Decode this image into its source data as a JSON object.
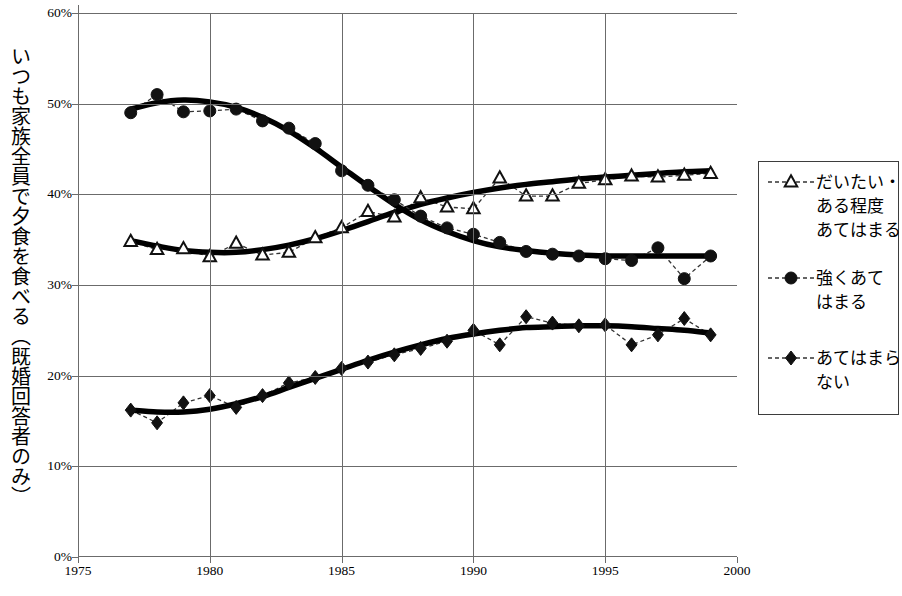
{
  "chart_data": {
    "type": "line",
    "title": "",
    "xlabel": "",
    "ylabel": "いつも家族全員で夕食を食べる（既婚回答者のみ）",
    "xlim": [
      1975,
      2000
    ],
    "ylim": [
      0,
      60
    ],
    "xticks": [
      1975,
      1980,
      1985,
      1990,
      1995,
      2000
    ],
    "xtick_labels": [
      "1975",
      "1980",
      "1985",
      "1990",
      "1995",
      "2000"
    ],
    "yticks": [
      0,
      10,
      20,
      30,
      40,
      50,
      60
    ],
    "ytick_labels": [
      "0%",
      "10%",
      "20%",
      "30%",
      "40%",
      "50%",
      "60%"
    ],
    "grid": "horizontal-and-vertical",
    "legend_position": "right-outside",
    "x": [
      1977,
      1978,
      1979,
      1980,
      1981,
      1982,
      1983,
      1984,
      1985,
      1986,
      1987,
      1988,
      1989,
      1990,
      1991,
      1992,
      1993,
      1994,
      1995,
      1996,
      1997,
      1998,
      1999
    ],
    "series": [
      {
        "name": "だいたい・\nある程度\nあてはまる",
        "marker": "open-triangle",
        "line": "dashed",
        "values": [
          34.8,
          33.9,
          34.0,
          33.1,
          34.6,
          33.3,
          33.6,
          35.2,
          36.3,
          38.1,
          37.5,
          39.6,
          38.6,
          38.4,
          41.8,
          39.8,
          39.8,
          41.2,
          41.6,
          42.0,
          41.9,
          42.1,
          42.3
        ],
        "trend": [
          34.9,
          34.3,
          33.8,
          33.6,
          33.6,
          33.9,
          34.4,
          35.1,
          36.0,
          37.0,
          38.0,
          38.9,
          39.6,
          40.2,
          40.7,
          41.1,
          41.4,
          41.7,
          41.9,
          42.1,
          42.3,
          42.5,
          42.6
        ]
      },
      {
        "name": "強くあて\nはまる",
        "marker": "filled-circle",
        "line": "dashed",
        "values": [
          49.0,
          51.0,
          49.1,
          49.2,
          49.4,
          48.1,
          47.3,
          45.6,
          42.6,
          41.0,
          39.4,
          37.6,
          36.3,
          35.6,
          34.7,
          33.7,
          33.4,
          33.2,
          32.9,
          32.7,
          34.1,
          30.7,
          33.2
        ],
        "trend": [
          49.4,
          50.1,
          50.4,
          50.2,
          49.6,
          48.5,
          47.0,
          45.1,
          43.0,
          40.9,
          38.9,
          37.2,
          35.9,
          34.9,
          34.2,
          33.8,
          33.5,
          33.3,
          33.2,
          33.2,
          33.2,
          33.2,
          33.2
        ]
      },
      {
        "name": "あてはまら\nない",
        "marker": "filled-diamond",
        "line": "dashed",
        "values": [
          16.2,
          14.8,
          17.0,
          17.8,
          16.5,
          17.8,
          19.2,
          19.8,
          20.8,
          21.5,
          22.3,
          23.0,
          23.8,
          25.0,
          23.4,
          26.5,
          25.8,
          25.5,
          25.6,
          23.4,
          24.5,
          26.3,
          24.5
        ],
        "trend": [
          16.2,
          16.0,
          16.0,
          16.3,
          16.9,
          17.7,
          18.7,
          19.7,
          20.7,
          21.7,
          22.6,
          23.4,
          24.1,
          24.6,
          25.0,
          25.3,
          25.4,
          25.5,
          25.5,
          25.4,
          25.2,
          25.0,
          24.7
        ]
      }
    ]
  },
  "legend": {
    "items": [
      {
        "label": "だいたい・\nある程度\nあてはまる",
        "marker": "open-triangle"
      },
      {
        "label": "強くあて\nはまる",
        "marker": "filled-circle"
      },
      {
        "label": "あてはまら\nない",
        "marker": "filled-diamond"
      }
    ]
  }
}
